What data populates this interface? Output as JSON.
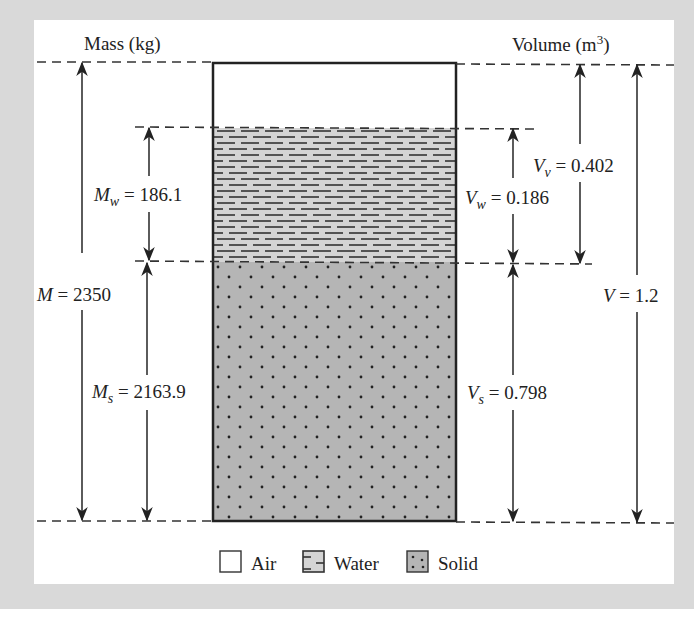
{
  "diagram": {
    "title_left": "Mass (kg)",
    "title_right_prefix": "Volume (m",
    "title_right_sup": "3",
    "title_right_suffix": ")",
    "phases": {
      "air": {
        "label": "Air",
        "fill": "#ffffff"
      },
      "water": {
        "label": "Water",
        "fill": "#d4d4d4"
      },
      "solid": {
        "label": "Solid",
        "fill": "#b5b5b5"
      }
    },
    "mass": {
      "total": {
        "symbol": "M",
        "sub": "",
        "value": "2350"
      },
      "water": {
        "symbol": "M",
        "sub": "w",
        "value": "186.1"
      },
      "solid": {
        "symbol": "M",
        "sub": "s",
        "value": "2163.9"
      }
    },
    "volume": {
      "total": {
        "symbol": "V",
        "sub": "",
        "value": "1.2"
      },
      "voids": {
        "symbol": "V",
        "sub": "v",
        "value": "0.402"
      },
      "water": {
        "symbol": "V",
        "sub": "w",
        "value": "0.186"
      },
      "solid": {
        "symbol": "V",
        "sub": "s",
        "value": "0.798"
      }
    },
    "colors": {
      "background": "#d9d9d9",
      "panel": "#ffffff",
      "line": "#222222"
    }
  }
}
